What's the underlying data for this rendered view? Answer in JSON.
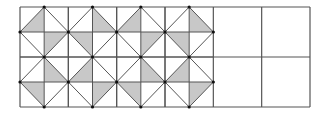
{
  "diagram": {
    "title": "",
    "grid": {
      "x": 20,
      "y": 7,
      "width": 290,
      "height": 100,
      "big_cols": 6,
      "big_rows": 2,
      "patterned_big_cols": 4
    },
    "colors": {
      "background": "#ffffff",
      "line": "#555555",
      "shade": "#c8c8c8",
      "dot": "#111111"
    },
    "cells": [
      {
        "row": 0,
        "col": 0,
        "shaded": [
          "TL",
          "BR"
        ]
      },
      {
        "row": 0,
        "col": 1,
        "shaded": [
          "TR",
          "BL"
        ]
      },
      {
        "row": 0,
        "col": 2,
        "shaded": [
          "TL",
          "BR"
        ]
      },
      {
        "row": 0,
        "col": 3,
        "shaded": [
          "TR",
          "BL"
        ]
      },
      {
        "row": 1,
        "col": 0,
        "shaded": [
          "TR",
          "BL"
        ]
      },
      {
        "row": 1,
        "col": 1,
        "shaded": [
          "TL",
          "BR"
        ]
      },
      {
        "row": 1,
        "col": 2,
        "shaded": [
          "TR",
          "BL"
        ]
      },
      {
        "row": 1,
        "col": 3,
        "shaded": [
          "TL",
          "BR"
        ]
      }
    ],
    "empty_cells": [
      {
        "row": 0,
        "col": 4
      },
      {
        "row": 0,
        "col": 5
      },
      {
        "row": 1,
        "col": 4
      },
      {
        "row": 1,
        "col": 5
      }
    ]
  }
}
